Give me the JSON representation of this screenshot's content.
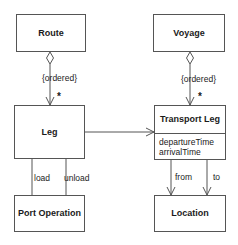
{
  "diagram": {
    "type": "UML class diagram",
    "classes": {
      "route": {
        "name": "Route"
      },
      "voyage": {
        "name": "Voyage"
      },
      "leg": {
        "name": "Leg"
      },
      "transport_leg": {
        "name": "Transport Leg",
        "attributes": [
          "departureTime",
          "arrivalTime"
        ]
      },
      "port_operation": {
        "name": "Port Operation"
      },
      "location": {
        "name": "Location"
      }
    },
    "associations": {
      "route_leg": {
        "constraint": "{ordered}",
        "multiplicity": "*",
        "kind": "aggregation"
      },
      "voyage_transport_leg": {
        "constraint": "{ordered}",
        "multiplicity": "*",
        "kind": "aggregation"
      },
      "leg_transport_leg": {
        "kind": "directed association"
      },
      "leg_port_operation_load": {
        "role": "load"
      },
      "leg_port_operation_unload": {
        "role": "unload"
      },
      "transport_leg_location_from": {
        "role": "from"
      },
      "transport_leg_location_to": {
        "role": "to"
      }
    }
  }
}
